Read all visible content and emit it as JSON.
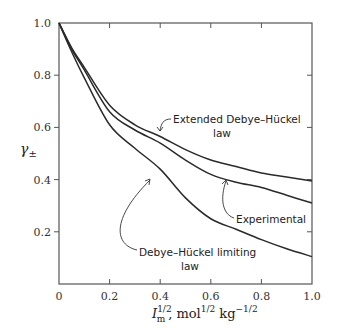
{
  "chart_data": {
    "type": "line",
    "title": "",
    "xlabel": {
      "base": "I",
      "sub": "m",
      "sup": "1/2",
      "rest": ", mol",
      "rest_sup": "1/2",
      "unit2": " kg",
      "unit2_sup": "−1/2"
    },
    "ylabel": {
      "base": "γ",
      "sub": "±"
    },
    "xlim": [
      0,
      1.0
    ],
    "ylim": [
      0,
      1.0
    ],
    "x_ticks": [
      "0",
      "0.2",
      "0.4",
      "0.6",
      "0.8",
      "1.0"
    ],
    "y_ticks": [
      "0.2",
      "0.4",
      "0.6",
      "0.8",
      "1.0"
    ],
    "grid": false,
    "x": [
      0,
      0.05,
      0.1,
      0.2,
      0.3,
      0.4,
      0.5,
      0.6,
      0.7,
      0.8,
      0.9,
      1.0
    ],
    "series": [
      {
        "name": "Extended Debye–Hückel law",
        "values": [
          1.0,
          0.905,
          0.83,
          0.685,
          0.61,
          0.565,
          0.515,
          0.475,
          0.45,
          0.425,
          0.41,
          0.395
        ]
      },
      {
        "name": "Experimental",
        "values": [
          1.0,
          0.9,
          0.82,
          0.66,
          0.59,
          0.54,
          0.475,
          0.42,
          0.39,
          0.37,
          0.34,
          0.31
        ]
      },
      {
        "name": "Debye–Hückel limiting law",
        "values": [
          1.0,
          0.89,
          0.79,
          0.61,
          0.52,
          0.44,
          0.33,
          0.25,
          0.21,
          0.17,
          0.135,
          0.105
        ]
      }
    ],
    "annotations": [
      {
        "line1": "Extended Debye–Hückel",
        "line2": "law",
        "points_to": "Extended Debye–Hückel law"
      },
      {
        "line1": "Experimental",
        "line2": "",
        "points_to": "Experimental"
      },
      {
        "line1": "Debye–Hückel limiting",
        "line2": "law",
        "points_to": "Debye–Hückel limiting law"
      }
    ]
  }
}
